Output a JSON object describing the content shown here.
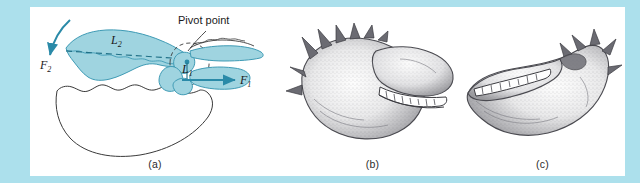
{
  "figure": {
    "border_color": "#ace0ec",
    "plate_background": "#ffffff",
    "shade_fill": "#9fd4e0",
    "shade_stroke": "#3f9bb5",
    "ink_stroke": "#3a3a3a",
    "arrow_color": "#2a8aa8"
  },
  "panels": [
    {
      "id": "a",
      "caption": "(a)",
      "type": "schematic-diagram",
      "labels": {
        "pivot": "Pivot point",
        "lever_long": "L",
        "lever_long_sub": "2",
        "lever_short": "L",
        "lever_short_sub": "1",
        "force_in": "F",
        "force_in_sub": "2",
        "force_out": "F",
        "force_out_sub": "1"
      }
    },
    {
      "id": "b",
      "caption": "(b)",
      "type": "stippled-claw-drawing"
    },
    {
      "id": "c",
      "caption": "(c)",
      "type": "stippled-claw-drawing"
    }
  ]
}
